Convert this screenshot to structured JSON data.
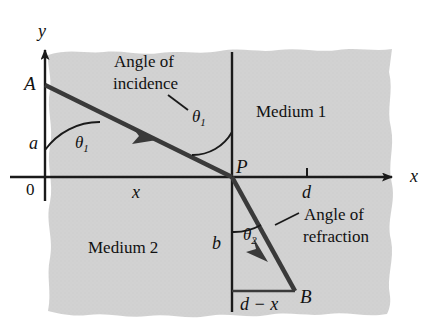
{
  "figure": {
    "axes": {
      "y_label": "y",
      "x_label": "x",
      "origin_label": "0"
    },
    "points": {
      "A": "A",
      "P": "P",
      "B": "B"
    },
    "segments": {
      "a": "a",
      "b": "b",
      "x": "x",
      "d": "d",
      "d_minus_x": "d − x"
    },
    "angles": {
      "theta1_at_surface": "θ",
      "theta1_sub": "1",
      "theta1_at_normal": "θ",
      "theta1_normal_sub": "1",
      "theta2": "θ",
      "theta2_sub": "2"
    },
    "media": {
      "upper": "Medium 1",
      "lower": "Medium 2"
    },
    "callouts": {
      "incidence_line1": "Angle of",
      "incidence_line2": "incidence",
      "refraction_line1": "Angle of",
      "refraction_line2": "refraction"
    },
    "colors": {
      "shading": "#cfcfcf",
      "ray": "#3a3a3a",
      "axis": "#1a1a1a",
      "text": "#111111",
      "background": "#ffffff"
    }
  }
}
